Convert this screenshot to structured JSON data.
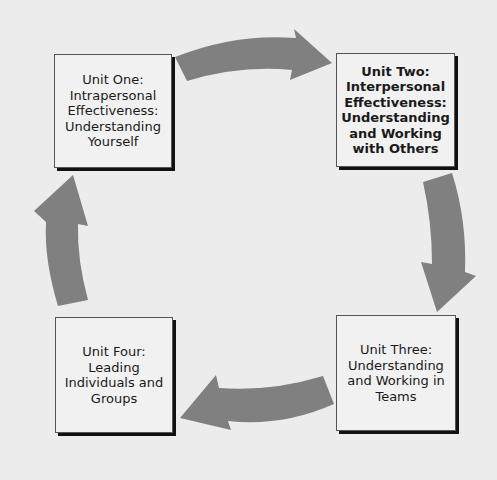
{
  "diagram": {
    "type": "cycle",
    "background_color": "#ececec",
    "arrow_color": "#808080",
    "units": [
      {
        "id": "unit-one",
        "label": "Unit One:\nIntrapersonal\nEffectiveness:\nUnderstanding\nYourself",
        "bold": false
      },
      {
        "id": "unit-two",
        "label": "Unit Two:\nInterpersonal\nEffectiveness:\nUnderstanding\nand Working\nwith Others",
        "bold": true
      },
      {
        "id": "unit-three",
        "label": "Unit Three:\nUnderstanding\nand Working in\nTeams",
        "bold": false
      },
      {
        "id": "unit-four",
        "label": "Unit Four:\nLeading\nIndividuals and\nGroups",
        "bold": false
      }
    ],
    "arrows": [
      {
        "from": "unit-one",
        "to": "unit-two",
        "direction": "right"
      },
      {
        "from": "unit-two",
        "to": "unit-three",
        "direction": "down"
      },
      {
        "from": "unit-three",
        "to": "unit-four",
        "direction": "left"
      },
      {
        "from": "unit-four",
        "to": "unit-one",
        "direction": "up"
      }
    ]
  }
}
